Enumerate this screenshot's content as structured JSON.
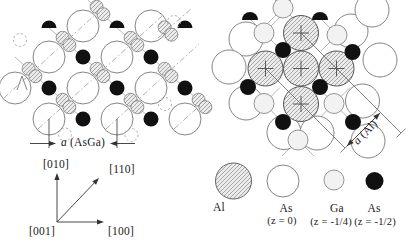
{
  "figure": {
    "width": 415,
    "height": 247,
    "background": "#ffffff"
  },
  "colors": {
    "black_atom": "#111111",
    "circle_stroke": "#777777",
    "al_stroke": "#555555",
    "hatch_line": "#8a8a8a",
    "hatch_bg": "#ebebeb",
    "ga_fill": "#f2f2f2",
    "bond": "#9a9a9a",
    "dashdot": "#9a9a9a",
    "annotation": "#333333"
  },
  "labels": {
    "asga_a": "a",
    "asga_rest": "(AsGa)",
    "axis_010": "[010]",
    "axis_110": "[110]",
    "axis_001": "[001]",
    "axis_100": "[100]",
    "aal_a": "a",
    "aal_rest": "(Al)"
  },
  "left_panel": {
    "as_large_radius": 16,
    "as_large": [
      [
        83,
        26
      ],
      [
        151,
        26
      ],
      [
        49,
        57
      ],
      [
        117,
        57
      ],
      [
        15,
        88
      ],
      [
        83,
        88
      ],
      [
        151,
        88
      ],
      [
        49,
        119
      ],
      [
        117,
        119
      ],
      [
        185,
        119
      ]
    ],
    "black_radius": 7.5,
    "black_full": [
      [
        83,
        57
      ],
      [
        151,
        57
      ],
      [
        49,
        88
      ],
      [
        117,
        88
      ],
      [
        185,
        88
      ],
      [
        83,
        119
      ],
      [
        151,
        119
      ]
    ],
    "black_semi": [
      [
        49,
        28
      ],
      [
        117,
        28
      ],
      [
        185,
        28
      ]
    ],
    "bowtie_radius": 6.5,
    "bowtie_offset": [
      3.4,
      3.7
    ],
    "bowties": [
      [
        32,
        72.5
      ],
      [
        66,
        41.5
      ],
      [
        100,
        72.5
      ],
      [
        134,
        41.5
      ],
      [
        66,
        103.5
      ],
      [
        134,
        103.5
      ],
      [
        168,
        72.5
      ],
      [
        202,
        103.5
      ],
      [
        100,
        10.5
      ],
      [
        168,
        31
      ]
    ],
    "ghost_radius": 6.5,
    "ghosts": [
      [
        20,
        40
      ],
      [
        65,
        134.5
      ],
      [
        131.5,
        135
      ],
      [
        165,
        104
      ],
      [
        174,
        22
      ]
    ],
    "dashdot_lines": [
      [
        4,
        98,
        96,
        14
      ],
      [
        38,
        129,
        162,
        16
      ],
      [
        106,
        129,
        199,
        44
      ],
      [
        174,
        129,
        207,
        99
      ],
      [
        158,
        38,
        192,
        8
      ]
    ],
    "bond_lines": [
      [
        49,
        28,
        83,
        57
      ],
      [
        117,
        28,
        151,
        57
      ],
      [
        15,
        57,
        49,
        88
      ],
      [
        83,
        57,
        117,
        88
      ],
      [
        151,
        57,
        185,
        88
      ],
      [
        49,
        88,
        83,
        119
      ],
      [
        117,
        88,
        151,
        119
      ],
      [
        88,
        0,
        117,
        28
      ],
      [
        185,
        88,
        205,
        107
      ]
    ],
    "lambda_mark": [
      [
        17,
        90
      ],
      [
        22,
        76
      ],
      [
        27,
        90
      ]
    ],
    "dimension": {
      "tick_x1": 49,
      "tick_x2": 117,
      "tick_y_top": 119,
      "tick_y_bot": 148,
      "arrow_y": 143.5,
      "arrow_left": [
        30,
        56
      ],
      "arrow_right": [
        135,
        110
      ]
    },
    "axes": {
      "origin": [
        57,
        222
      ],
      "up_end": [
        57,
        173
      ],
      "diag_end": [
        99,
        178
      ],
      "right_end": [
        104,
        222
      ]
    }
  },
  "right_panel": {
    "al_radius": 17.5,
    "al": [
      [
        301,
        33
      ],
      [
        265.5,
        68.5
      ],
      [
        301,
        68.5
      ],
      [
        336.5,
        68.5
      ],
      [
        301,
        104
      ]
    ],
    "al_cross_arm": 8,
    "as_large_radius": 17,
    "as_large": [
      [
        246,
        39
      ],
      [
        351,
        31
      ],
      [
        229,
        67
      ],
      [
        246,
        103
      ],
      [
        284,
        132.5
      ],
      [
        317,
        133
      ],
      [
        362.5,
        101
      ],
      [
        380,
        60
      ],
      [
        368,
        141
      ],
      [
        372,
        10
      ]
    ],
    "ga_radius": 10,
    "ga": [
      [
        264,
        33
      ],
      [
        337,
        35
      ],
      [
        264,
        103.5
      ],
      [
        334,
        103.5
      ],
      [
        298,
        140
      ],
      [
        283,
        8
      ]
    ],
    "ga_bond_arm": 16,
    "black_radius": 8,
    "black_full": [
      [
        283,
        50
      ],
      [
        352.5,
        52
      ],
      [
        248,
        87
      ],
      [
        320,
        87
      ],
      [
        283,
        122
      ],
      [
        353,
        122
      ]
    ],
    "black_semi": [
      [
        250,
        20
      ],
      [
        320,
        20
      ]
    ],
    "dimension": {
      "line1": [
        301,
        33,
        401,
        133
      ],
      "line2": [
        265.5,
        68.5,
        345,
        148
      ],
      "arrow": [
        347,
        146,
        380,
        113
      ],
      "tick_len": 4.5
    }
  },
  "legend": {
    "circle_y": 181,
    "items": [
      {
        "type": "al",
        "label": "Al",
        "sub": "",
        "cx": 233.5,
        "r": 18
      },
      {
        "type": "as",
        "label": "As",
        "sub": "(z = 0)",
        "cx": 283,
        "r": 16
      },
      {
        "type": "ga",
        "label": "Ga",
        "sub": "(z = -1/4)",
        "cx": 334,
        "r": 10
      },
      {
        "type": "black",
        "label": "As",
        "sub": "(z = -1/2)",
        "cx": 374.5,
        "r": 9
      }
    ]
  }
}
